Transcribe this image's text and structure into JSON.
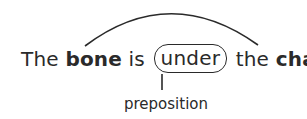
{
  "diagram": {
    "sentence": {
      "word1": "The",
      "subject": "bone",
      "verb": "is",
      "preposition_word": "under",
      "article": "the",
      "object": "chair",
      "period": "."
    },
    "label": "preposition",
    "connections": [
      {
        "type": "arc",
        "from": "bone",
        "to": "chair"
      },
      {
        "type": "stem",
        "from": "under",
        "to": "preposition"
      }
    ],
    "colors": {
      "ink": "#2a2a2a",
      "background": "#ffffff"
    }
  }
}
